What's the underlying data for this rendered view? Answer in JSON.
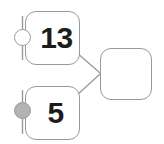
{
  "diagram": {
    "background_color": "#ffffff",
    "stroke_color": "#9a9a9a",
    "text_color": "#1c1c1c",
    "port_filled_color": "#b3b3b3",
    "port_hollow_color": "#ffffff",
    "nodes": [
      {
        "id": "node-top",
        "label": "13",
        "port": {
          "name": "input-port-hollow",
          "state": "unfilled"
        }
      },
      {
        "id": "node-bottom",
        "label": "5",
        "port": {
          "name": "input-port-filled",
          "state": "filled"
        }
      },
      {
        "id": "node-right",
        "label": ""
      }
    ],
    "edges": [
      {
        "id": "edge-top-to-right",
        "from": "node-top",
        "to": "node-right"
      },
      {
        "id": "edge-bottom-to-right",
        "from": "node-bottom",
        "to": "node-right"
      }
    ]
  }
}
